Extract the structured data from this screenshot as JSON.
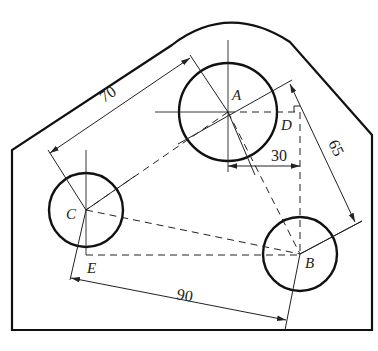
{
  "figure": {
    "type": "engineering-drawing",
    "points": [
      {
        "name": "A",
        "label": "A"
      },
      {
        "name": "B",
        "label": "B"
      },
      {
        "name": "C",
        "label": "C"
      },
      {
        "name": "D",
        "label": "D"
      },
      {
        "name": "E",
        "label": "E"
      }
    ],
    "dimensions": {
      "ca": "70",
      "ab": "65",
      "ad": "30",
      "cb": "90"
    },
    "colors": {
      "stroke": "#111111",
      "background": "#ffffff"
    }
  }
}
